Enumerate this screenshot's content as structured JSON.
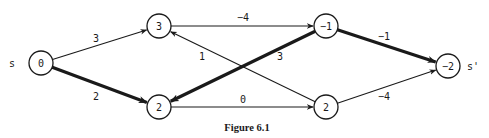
{
  "figure": {
    "caption": "Figure 6.1",
    "source_label": "s",
    "sink_label": "s'"
  },
  "nodes": [
    {
      "id": "n0",
      "label": "0",
      "x": 41,
      "y": 63
    },
    {
      "id": "n1",
      "label": "3",
      "x": 159,
      "y": 26
    },
    {
      "id": "n2",
      "label": "2",
      "x": 159,
      "y": 107
    },
    {
      "id": "n3",
      "label": "-1",
      "x": 326,
      "y": 26
    },
    {
      "id": "n4",
      "label": "2",
      "x": 326,
      "y": 107
    },
    {
      "id": "n5",
      "label": "-2",
      "x": 448,
      "y": 66
    }
  ],
  "edges": [
    {
      "from": "n0",
      "to": "n1",
      "label": "3",
      "bold": false,
      "lx": 96,
      "ly": 38
    },
    {
      "from": "n0",
      "to": "n2",
      "label": "2",
      "bold": true,
      "lx": 96,
      "ly": 96
    },
    {
      "from": "n1",
      "to": "n3",
      "label": "-4",
      "bold": false,
      "lx": 243,
      "ly": 17
    },
    {
      "from": "n4",
      "to": "n1",
      "label": "1",
      "bold": false,
      "lx": 202,
      "ly": 56
    },
    {
      "from": "n3",
      "to": "n2",
      "label": "3",
      "bold": true,
      "lx": 280,
      "ly": 56
    },
    {
      "from": "n2",
      "to": "n4",
      "label": "0",
      "bold": false,
      "lx": 243,
      "ly": 99
    },
    {
      "from": "n3",
      "to": "n5",
      "label": "-1",
      "bold": true,
      "lx": 384,
      "ly": 36
    },
    {
      "from": "n4",
      "to": "n5",
      "label": "-4",
      "bold": false,
      "lx": 384,
      "ly": 96
    }
  ],
  "colors": {
    "ink": "#1a1a1a",
    "background": "#ffffff"
  }
}
